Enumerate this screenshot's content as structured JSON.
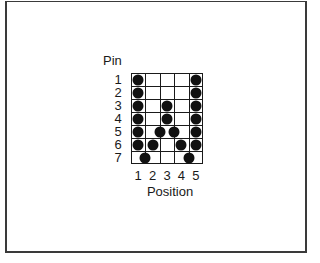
{
  "diagram": {
    "y_axis_title": "Pin",
    "x_axis_title": "Position",
    "rows": [
      "1",
      "2",
      "3",
      "4",
      "5",
      "6",
      "7"
    ],
    "columns": [
      "1",
      "2",
      "3",
      "4",
      "5"
    ],
    "dots": [
      {
        "pin": 1,
        "pos": 1
      },
      {
        "pin": 1,
        "pos": 5
      },
      {
        "pin": 2,
        "pos": 1
      },
      {
        "pin": 2,
        "pos": 5
      },
      {
        "pin": 3,
        "pos": 1
      },
      {
        "pin": 3,
        "pos": 3
      },
      {
        "pin": 3,
        "pos": 5
      },
      {
        "pin": 4,
        "pos": 1
      },
      {
        "pin": 4,
        "pos": 3
      },
      {
        "pin": 4,
        "pos": 5
      },
      {
        "pin": 5,
        "pos": 1
      },
      {
        "pin": 5,
        "pos": 2.5
      },
      {
        "pin": 5,
        "pos": 3.5
      },
      {
        "pin": 5,
        "pos": 5
      },
      {
        "pin": 6,
        "pos": 1
      },
      {
        "pin": 6,
        "pos": 2
      },
      {
        "pin": 6,
        "pos": 4
      },
      {
        "pin": 6,
        "pos": 5
      },
      {
        "pin": 7,
        "pos": 1.5
      },
      {
        "pin": 7,
        "pos": 4.5
      }
    ]
  }
}
